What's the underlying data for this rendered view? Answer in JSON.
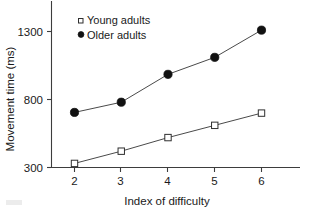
{
  "chart_data": {
    "type": "line",
    "title": "",
    "subtitle": "",
    "xlabel": "Index of difficulty",
    "ylabel": "Movement time (ms)",
    "x": [
      2,
      3,
      4,
      5,
      6
    ],
    "xticklabels": [
      "2",
      "3",
      "4",
      "5",
      "6"
    ],
    "yticks": [
      300,
      800,
      1300
    ],
    "yticklabels": [
      "300",
      "800",
      "1300"
    ],
    "xlim": [
      1.6,
      6.6
    ],
    "ylim": [
      300,
      1400
    ],
    "grid": false,
    "legend_position": "top-left-inside",
    "series": [
      {
        "name": "Young adults",
        "marker": "open-square",
        "values": [
          330,
          420,
          520,
          610,
          700
        ]
      },
      {
        "name": "Older adults",
        "marker": "filled-circle",
        "values": [
          705,
          780,
          985,
          1110,
          1310
        ]
      }
    ],
    "colors": {
      "line": "#4a4a4a",
      "filled_marker": "#111111",
      "open_marker_fill": "#ffffff",
      "open_marker_stroke": "#2f2f2f",
      "axis": "#3d3d3d",
      "text": "#1a1a1a",
      "background": "#ffffff"
    }
  },
  "legend": {
    "entries": [
      {
        "label": "Young adults",
        "marker": "open-square"
      },
      {
        "label": "Older adults",
        "marker": "filled-circle"
      }
    ]
  },
  "axes": {
    "y_title": "Movement time (ms)",
    "x_title": "Index of difficulty",
    "y_tick_1": "1300",
    "y_tick_2": "800",
    "y_tick_3": "300",
    "x_tick_1": "2",
    "x_tick_2": "3",
    "x_tick_3": "4",
    "x_tick_4": "5",
    "x_tick_5": "6"
  }
}
